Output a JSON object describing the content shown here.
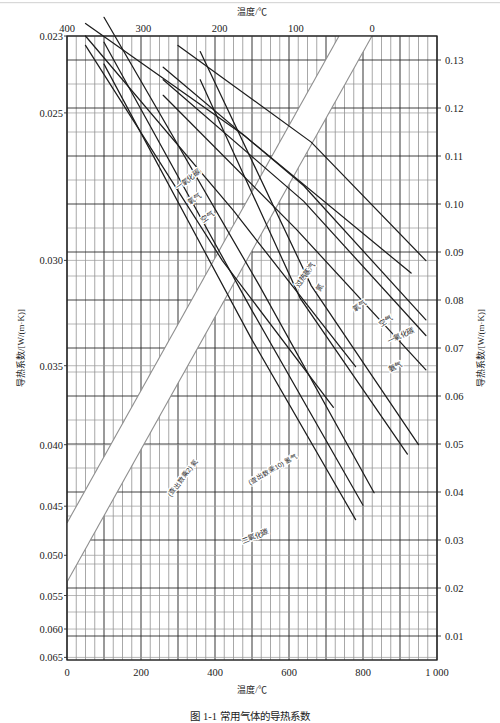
{
  "figure": {
    "caption": "图 1-1  常用气体的导热系数",
    "top_axis": {
      "title": "温度/℃",
      "ticks": [
        "400",
        "300",
        "200",
        "100",
        "0"
      ],
      "values": [
        400,
        300,
        200,
        100,
        0
      ]
    },
    "bottom_axis": {
      "title": "温度/℃",
      "ticks": [
        "0",
        "200",
        "400",
        "600",
        "800",
        "1 000"
      ],
      "values": [
        0,
        200,
        400,
        600,
        800,
        1000
      ]
    },
    "left_axis": {
      "title": "导热系数/[W/(m·K)]",
      "ticks": [
        "0.023",
        "0.025",
        "0.030",
        "0.035",
        "0.040",
        "0.045",
        "0.050",
        "0.055",
        "0.060",
        "0.065"
      ],
      "values": [
        0.023,
        0.025,
        0.03,
        0.035,
        0.04,
        0.045,
        0.05,
        0.055,
        0.06,
        0.065
      ]
    },
    "right_axis": {
      "title": "导热系数/[W/(m·K)]",
      "ticks": [
        "0.13",
        "0.12",
        "0.11",
        "0.10",
        "0.09",
        "0.08",
        "0.07",
        "0.06",
        "0.05",
        "0.04",
        "0.03",
        "0.02",
        "0.01"
      ],
      "values": [
        0.13,
        0.12,
        0.11,
        0.1,
        0.09,
        0.08,
        0.07,
        0.06,
        0.05,
        0.04,
        0.03,
        0.02,
        0.01
      ]
    },
    "notes": [
      "(查出数乘2)",
      "(查出数乘10)"
    ]
  },
  "chart_data": {
    "type": "line",
    "title": "图 1-1  常用气体的导热系数",
    "xlabel": "温度/℃",
    "ylabel": "导热系数/[W/(m·K)]",
    "grid": true,
    "legend": "inline-curve-labels",
    "axes": {
      "top_x": {
        "label": "温度/℃",
        "range": [
          400,
          0
        ],
        "ticks": [
          400,
          300,
          200,
          100,
          0
        ],
        "direction": "decreasing-right"
      },
      "bottom_x": {
        "label": "温度/℃",
        "range": [
          0,
          1000
        ],
        "ticks": [
          0,
          200,
          400,
          600,
          800,
          1000
        ],
        "direction": "increasing-right"
      },
      "left_y": {
        "label": "导热系数/[W/(m·K)]",
        "range": [
          0.023,
          0.065
        ],
        "ticks": [
          0.023,
          0.025,
          0.03,
          0.035,
          0.04,
          0.045,
          0.05,
          0.055,
          0.06,
          0.065
        ],
        "direction": "increasing-down"
      },
      "right_y": {
        "label": "导热系数/[W/(m·K)]",
        "range": [
          0.13,
          0.01
        ],
        "ticks": [
          0.13,
          0.12,
          0.11,
          0.1,
          0.09,
          0.08,
          0.07,
          0.06,
          0.05,
          0.04,
          0.03,
          0.02,
          0.01
        ],
        "direction": "decreasing-down"
      }
    },
    "series": [
      {
        "name": "一氧化碳",
        "group": "upper-left",
        "note": "",
        "points": [
          [
            0.1,
            0.955
          ],
          [
            0.5,
            0.513
          ],
          [
            0.78,
            0.225
          ]
        ]
      },
      {
        "name": "氧气",
        "group": "upper-left",
        "note": "",
        "points": [
          [
            0.1,
            0.99
          ],
          [
            0.5,
            0.56
          ],
          [
            0.8,
            0.248
          ]
        ]
      },
      {
        "name": "空气",
        "group": "upper-left",
        "note": "",
        "points": [
          [
            0.1,
            1.03
          ],
          [
            0.52,
            0.6
          ],
          [
            0.83,
            0.268
          ]
        ]
      },
      {
        "name": "过热蒸汽",
        "group": "lower-right",
        "note": "",
        "points": [
          [
            0.36,
            0.93
          ],
          [
            0.63,
            0.58
          ],
          [
            0.92,
            0.33
          ]
        ]
      },
      {
        "name": "氮",
        "group": "lower-right",
        "note": "",
        "points": [
          [
            0.36,
            0.975
          ],
          [
            0.66,
            0.6
          ],
          [
            0.95,
            0.345
          ]
        ]
      },
      {
        "name": "氧气",
        "group": "lower-right",
        "note": "",
        "points": [
          [
            0.26,
            0.905
          ],
          [
            0.62,
            0.69
          ],
          [
            0.97,
            0.465
          ]
        ]
      },
      {
        "name": "空气",
        "group": "lower-right",
        "note": "",
        "points": [
          [
            0.26,
            0.93
          ],
          [
            0.64,
            0.735
          ],
          [
            0.97,
            0.52
          ]
        ]
      },
      {
        "name": "一氧化碳",
        "group": "lower-right",
        "note": "",
        "points": [
          [
            0.26,
            0.95
          ],
          [
            0.64,
            0.76
          ],
          [
            0.97,
            0.545
          ]
        ]
      },
      {
        "name": "氨气",
        "group": "lower-right",
        "note": "",
        "points": [
          [
            0.3,
            0.985
          ],
          [
            0.66,
            0.83
          ],
          [
            0.97,
            0.64
          ]
        ]
      },
      {
        "name": "氦",
        "group": "lower-right",
        "note": "(查出数乘2)",
        "points": [
          [
            0.05,
            0.985
          ],
          [
            0.42,
            0.64
          ],
          [
            0.72,
            0.405
          ]
        ]
      },
      {
        "name": "氢气",
        "group": "lower-right",
        "note": "(查出数乘10)",
        "points": [
          [
            0.05,
            1.0
          ],
          [
            0.45,
            0.72
          ],
          [
            0.78,
            0.47
          ]
        ]
      },
      {
        "name": "二氧化碳",
        "group": "lower-right",
        "note": "",
        "points": [
          [
            0.05,
            1.02
          ],
          [
            0.48,
            0.84
          ],
          [
            0.93,
            0.62
          ]
        ]
      }
    ],
    "curve_labels": [
      {
        "text": "一氧化碳",
        "x": 178,
        "y": 190,
        "rotate": -37
      },
      {
        "text": "氧气",
        "x": 190,
        "y": 205,
        "rotate": -37
      },
      {
        "text": "空气",
        "x": 203,
        "y": 223,
        "rotate": -37
      },
      {
        "text": "过热蒸汽",
        "x": 299,
        "y": 288,
        "rotate": -55
      },
      {
        "text": "氮",
        "x": 320,
        "y": 292,
        "rotate": -60
      },
      {
        "text": "氧气",
        "x": 355,
        "y": 312,
        "rotate": -37
      },
      {
        "text": "空气",
        "x": 381,
        "y": 327,
        "rotate": -34
      },
      {
        "text": "一氧化碳",
        "x": 389,
        "y": 344,
        "rotate": -26
      },
      {
        "text": "氨气",
        "x": 390,
        "y": 372,
        "rotate": -26
      },
      {
        "text": "(查出数乘2) 氦",
        "x": 171,
        "y": 497,
        "rotate": -53
      },
      {
        "text": "(查出数乘10) 氢气",
        "x": 250,
        "y": 485,
        "rotate": -30
      },
      {
        "text": "二氧化碳",
        "x": 243,
        "y": 544,
        "rotate": -22
      }
    ]
  }
}
